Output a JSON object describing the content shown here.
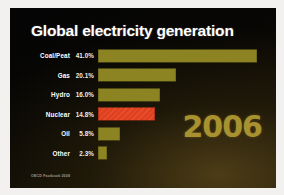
{
  "slide": {
    "title": "Global electricity generation",
    "year_stamp": "2006",
    "source_note": "OECD Factbook 2008",
    "colors": {
      "background": "#080604",
      "bar": "#8c8323",
      "highlight_bar": "#e0401d",
      "title_text": "#ffffff",
      "year_text": "#a8912f",
      "source_text": "#a09a8a"
    }
  },
  "chart_data": {
    "type": "bar",
    "title": "Global electricity generation",
    "subtitle": "2006",
    "orientation": "horizontal",
    "xlabel": "",
    "ylabel": "",
    "xlim": [
      0,
      45
    ],
    "grid": false,
    "legend": "none",
    "units": "percent",
    "annotations": [
      "2006",
      "OECD Factbook 2008"
    ],
    "highlight_category": "Nuclear",
    "categories": [
      "Coal/Peat",
      "Gas",
      "Hydro",
      "Nuclear",
      "Oil",
      "Other"
    ],
    "values": [
      41.0,
      20.1,
      16.0,
      14.8,
      5.8,
      2.3
    ],
    "value_labels": [
      "41.0%",
      "20.1%",
      "16.0%",
      "14.8%",
      "5.8%",
      "2.3%"
    ],
    "rows": [
      {
        "category": "Coal/Peat",
        "value": 41.0,
        "value_label": "41.0%",
        "highlight": false
      },
      {
        "category": "Gas",
        "value": 20.1,
        "value_label": "20.1%",
        "highlight": false
      },
      {
        "category": "Hydro",
        "value": 16.0,
        "value_label": "16.0%",
        "highlight": false
      },
      {
        "category": "Nuclear",
        "value": 14.8,
        "value_label": "14.8%",
        "highlight": true
      },
      {
        "category": "Oil",
        "value": 5.8,
        "value_label": "5.8%",
        "highlight": false
      },
      {
        "category": "Other",
        "value": 2.3,
        "value_label": "2.3%",
        "highlight": false
      }
    ]
  }
}
